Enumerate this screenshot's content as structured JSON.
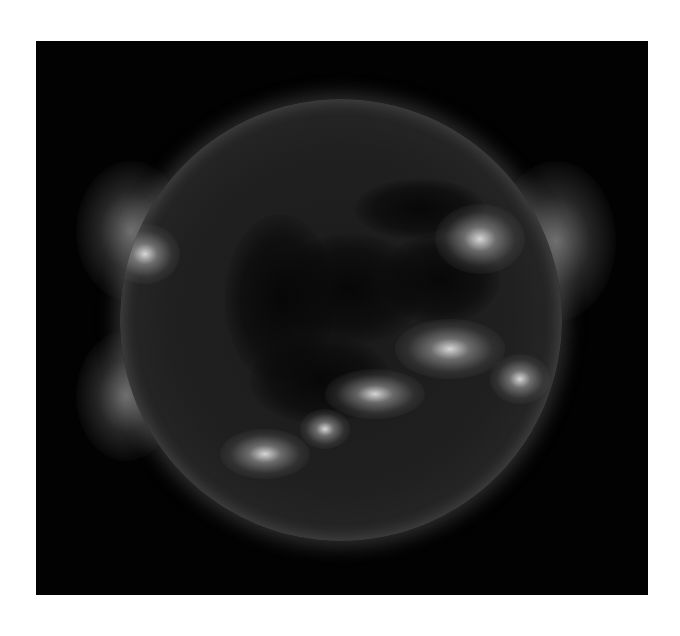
{
  "image": {
    "subject": "Sun in extreme ultraviolet, grayscale",
    "background_color": "#ffffff",
    "frame_color": "#020202",
    "features": {
      "coronal_holes": [
        {
          "cx": 230,
          "cy": 190,
          "w": 150,
          "h": 110
        },
        {
          "cx": 160,
          "cy": 200,
          "w": 110,
          "h": 170
        },
        {
          "cx": 300,
          "cy": 110,
          "w": 130,
          "h": 60
        },
        {
          "cx": 320,
          "cy": 180,
          "w": 120,
          "h": 90
        },
        {
          "cx": 200,
          "cy": 280,
          "w": 140,
          "h": 90
        }
      ],
      "active_regions": [
        {
          "cx": 145,
          "cy": 355,
          "w": 90,
          "h": 50
        },
        {
          "cx": 255,
          "cy": 295,
          "w": 100,
          "h": 50
        },
        {
          "cx": 330,
          "cy": 250,
          "w": 110,
          "h": 60
        },
        {
          "cx": 360,
          "cy": 140,
          "w": 90,
          "h": 70
        },
        {
          "cx": 25,
          "cy": 155,
          "w": 70,
          "h": 60
        },
        {
          "cx": 400,
          "cy": 280,
          "w": 60,
          "h": 50
        },
        {
          "cx": 205,
          "cy": 330,
          "w": 50,
          "h": 40
        }
      ],
      "limb_glows": [
        {
          "x": 40,
          "y": 120,
          "w": 110,
          "h": 140
        },
        {
          "x": 460,
          "y": 120,
          "w": 120,
          "h": 160
        },
        {
          "x": 40,
          "y": 290,
          "w": 100,
          "h": 130
        }
      ]
    }
  }
}
